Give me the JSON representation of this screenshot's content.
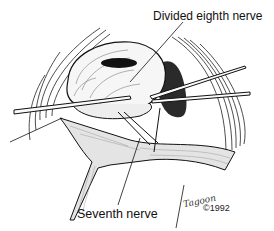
{
  "figure": {
    "type": "surgical line-art illustration",
    "labels": {
      "divided_eighth_nerve": "Divided eighth nerve",
      "seventh_nerve": "Seventh nerve"
    },
    "signature": "Tagoon",
    "copyright": "©1992",
    "colors": {
      "ink": "#111111",
      "background": "#ffffff",
      "shadow": "#2a2a2a"
    }
  }
}
